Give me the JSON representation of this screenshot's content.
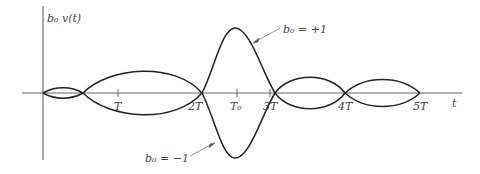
{
  "figure": {
    "y_label": "b₀ v(t)",
    "x_label": "t",
    "ticks": [
      {
        "label": "T",
        "x": 118
      },
      {
        "label": "2T",
        "x": 202
      },
      {
        "label": "T₀",
        "x": 237
      },
      {
        "label": "3T",
        "x": 275
      },
      {
        "label": "4T",
        "x": 345
      },
      {
        "label": "5T",
        "x": 420
      }
    ],
    "annotations": {
      "positive": "b₀ = +1",
      "negative": "b₀ = −1"
    },
    "colors": {
      "curve": "#222222",
      "axis": "#555555",
      "text": "#444444"
    }
  }
}
